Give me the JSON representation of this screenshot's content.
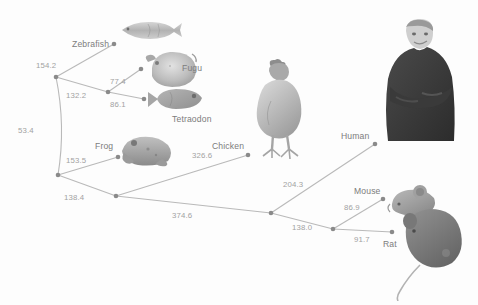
{
  "figure": {
    "type": "phylogenetic-tree",
    "background_color": "#fdfdfd",
    "edge_color": "#b9b9b9",
    "node_color": "#8a8a8a",
    "label_color": "#7c7c7c",
    "branch_label_color": "#a2a2a2"
  },
  "taxa": [
    {
      "id": "zebrafish",
      "label": "Zebrafish",
      "node_x": 114,
      "node_y": 44,
      "label_x": 72,
      "label_y": 40
    },
    {
      "id": "fugu",
      "label": "Fugu",
      "node_x": 141,
      "node_y": 69,
      "label_x": 182,
      "label_y": 64
    },
    {
      "id": "tetraodon",
      "label": "Tetraodon",
      "node_x": 144,
      "node_y": 99,
      "label_x": 172,
      "label_y": 115
    },
    {
      "id": "frog",
      "label": "Frog",
      "node_x": 118,
      "node_y": 157,
      "label_x": 95,
      "label_y": 142
    },
    {
      "id": "chicken",
      "label": "Chicken",
      "node_x": 248,
      "node_y": 155,
      "label_x": 212,
      "label_y": 142
    },
    {
      "id": "human",
      "label": "Human",
      "node_x": 375,
      "node_y": 144,
      "label_x": 341,
      "label_y": 132
    },
    {
      "id": "mouse",
      "label": "Mouse",
      "node_x": 383,
      "node_y": 199,
      "label_x": 354,
      "label_y": 187
    },
    {
      "id": "rat",
      "label": "Rat",
      "node_x": 392,
      "node_y": 232,
      "label_x": 383,
      "label_y": 240
    }
  ],
  "internal_nodes": [
    {
      "id": "n-fish-root",
      "x": 56,
      "y": 77
    },
    {
      "id": "n-pufferfish",
      "x": 108,
      "y": 92
    },
    {
      "id": "n-tetrapod",
      "x": 58,
      "y": 175
    },
    {
      "id": "n-amniote",
      "x": 116,
      "y": 196
    },
    {
      "id": "n-mammal",
      "x": 271,
      "y": 213
    },
    {
      "id": "n-rodent",
      "x": 333,
      "y": 229
    }
  ],
  "branch_lengths": [
    {
      "id": "bl-zebrafish",
      "value": "154.2",
      "x": 36,
      "y": 62
    },
    {
      "id": "bl-pufferfish-stem",
      "value": "132.2",
      "x": 66,
      "y": 92
    },
    {
      "id": "bl-fugu",
      "value": "77.4",
      "x": 110,
      "y": 78
    },
    {
      "id": "bl-tetraodon",
      "value": "86.1",
      "x": 110,
      "y": 101
    },
    {
      "id": "bl-fish-tetrapod",
      "value": "53.4",
      "x": 18,
      "y": 127
    },
    {
      "id": "bl-frog",
      "value": "153.5",
      "x": 66,
      "y": 157
    },
    {
      "id": "bl-amniote-stem",
      "value": "138.4",
      "x": 64,
      "y": 194
    },
    {
      "id": "bl-chicken",
      "value": "326.6",
      "x": 192,
      "y": 152
    },
    {
      "id": "bl-mammal-stem",
      "value": "374.6",
      "x": 172,
      "y": 212
    },
    {
      "id": "bl-human",
      "value": "204.3",
      "x": 283,
      "y": 181
    },
    {
      "id": "bl-rodent-stem",
      "value": "138.0",
      "x": 292,
      "y": 224
    },
    {
      "id": "bl-mouse",
      "value": "86.9",
      "x": 344,
      "y": 204
    },
    {
      "id": "bl-rat",
      "value": "91.7",
      "x": 354,
      "y": 236
    }
  ],
  "edges": [
    {
      "id": "e-root-zebrafish",
      "from": "n-fish-root",
      "to": "zebrafish"
    },
    {
      "id": "e-root-pufferfish",
      "from": "n-fish-root",
      "to": "n-pufferfish"
    },
    {
      "id": "e-pufferfish-fugu",
      "from": "n-pufferfish",
      "to": "fugu"
    },
    {
      "id": "e-pufferfish-tetraodon",
      "from": "n-pufferfish",
      "to": "tetraodon"
    },
    {
      "id": "e-root-tetrapod",
      "from": "n-fish-root",
      "to": "n-tetrapod"
    },
    {
      "id": "e-tetrapod-frog",
      "from": "n-tetrapod",
      "to": "frog"
    },
    {
      "id": "e-tetrapod-amniote",
      "from": "n-tetrapod",
      "to": "n-amniote"
    },
    {
      "id": "e-amniote-chicken",
      "from": "n-amniote",
      "to": "chicken"
    },
    {
      "id": "e-amniote-mammal",
      "from": "n-amniote",
      "to": "n-mammal"
    },
    {
      "id": "e-mammal-human",
      "from": "n-mammal",
      "to": "human"
    },
    {
      "id": "e-mammal-rodent",
      "from": "n-mammal",
      "to": "n-rodent"
    },
    {
      "id": "e-rodent-mouse",
      "from": "n-rodent",
      "to": "mouse"
    },
    {
      "id": "e-rodent-rat",
      "from": "n-rodent",
      "to": "rat"
    }
  ],
  "organism_images": [
    {
      "id": "img-zebrafish",
      "name": "zebrafish-photo",
      "x": 118,
      "y": 18,
      "w": 66,
      "h": 24
    },
    {
      "id": "img-fugu",
      "name": "fugu-photo",
      "x": 140,
      "y": 46,
      "w": 60,
      "h": 44
    },
    {
      "id": "img-tetraodon",
      "name": "tetraodon-photo",
      "x": 146,
      "y": 86,
      "w": 60,
      "h": 26
    },
    {
      "id": "img-frog",
      "name": "frog-photo",
      "x": 118,
      "y": 133,
      "w": 58,
      "h": 36
    },
    {
      "id": "img-chicken",
      "name": "chicken-photo",
      "x": 249,
      "y": 57,
      "w": 62,
      "h": 105
    },
    {
      "id": "img-human",
      "name": "human-photo",
      "x": 376,
      "y": 17,
      "w": 84,
      "h": 128
    },
    {
      "id": "img-mouse",
      "name": "mouse-photo",
      "x": 386,
      "y": 182,
      "w": 52,
      "h": 38
    },
    {
      "id": "img-rat",
      "name": "rat-photo",
      "x": 396,
      "y": 205,
      "w": 74,
      "h": 96
    }
  ]
}
